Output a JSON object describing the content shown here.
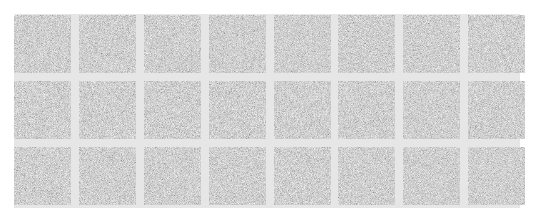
{
  "grid": {
    "rows": 3,
    "columns": 8,
    "tile_count": 24,
    "tile_fill": "noise-texture",
    "colors": {
      "page_background": "#ffffff",
      "gutter": "#e6e6e6",
      "tile_base": "#a9a9a9"
    }
  },
  "tiles": [
    {
      "row": 1,
      "col": 1
    },
    {
      "row": 1,
      "col": 2
    },
    {
      "row": 1,
      "col": 3
    },
    {
      "row": 1,
      "col": 4
    },
    {
      "row": 1,
      "col": 5
    },
    {
      "row": 1,
      "col": 6
    },
    {
      "row": 1,
      "col": 7
    },
    {
      "row": 1,
      "col": 8
    },
    {
      "row": 2,
      "col": 1
    },
    {
      "row": 2,
      "col": 2
    },
    {
      "row": 2,
      "col": 3
    },
    {
      "row": 2,
      "col": 4
    },
    {
      "row": 2,
      "col": 5
    },
    {
      "row": 2,
      "col": 6
    },
    {
      "row": 2,
      "col": 7
    },
    {
      "row": 2,
      "col": 8
    },
    {
      "row": 3,
      "col": 1
    },
    {
      "row": 3,
      "col": 2
    },
    {
      "row": 3,
      "col": 3
    },
    {
      "row": 3,
      "col": 4
    },
    {
      "row": 3,
      "col": 5
    },
    {
      "row": 3,
      "col": 6
    },
    {
      "row": 3,
      "col": 7
    },
    {
      "row": 3,
      "col": 8
    }
  ]
}
